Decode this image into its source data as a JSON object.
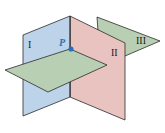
{
  "diagram": {
    "type": "three-intersecting-planes",
    "planes": [
      {
        "id": "I",
        "label": "I",
        "color": "#bcd3ea"
      },
      {
        "id": "II",
        "label": "II",
        "color": "#e9c3c0"
      },
      {
        "id": "III",
        "label": "III",
        "color": "#b9cfb3"
      }
    ],
    "point": {
      "label": "P",
      "color": "#2a6fb8"
    },
    "edge_color": "#2b2b2b",
    "caption": "..."
  }
}
